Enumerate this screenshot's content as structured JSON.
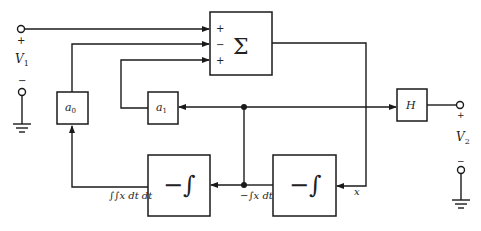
{
  "diagram": {
    "title": "",
    "input": {
      "label": "V",
      "subscript": "1",
      "plus": "+",
      "minus": "−"
    },
    "output": {
      "label": "V",
      "subscript": "2",
      "plus": "+",
      "minus": "−"
    },
    "blocks": {
      "summer": {
        "symbol": "Σ",
        "inputs": [
          "+",
          "−",
          "+"
        ]
      },
      "a0": {
        "label": "a",
        "subscript": "0"
      },
      "a1": {
        "label": "a",
        "subscript": "1"
      },
      "h": {
        "label": "H"
      },
      "integrator_right": {
        "symbol": "−∫"
      },
      "integrator_left": {
        "symbol": "−∫"
      }
    },
    "signals": {
      "x": "x",
      "first_integral": "−∫x dt",
      "second_integral": "∫∫x dt dt"
    }
  }
}
